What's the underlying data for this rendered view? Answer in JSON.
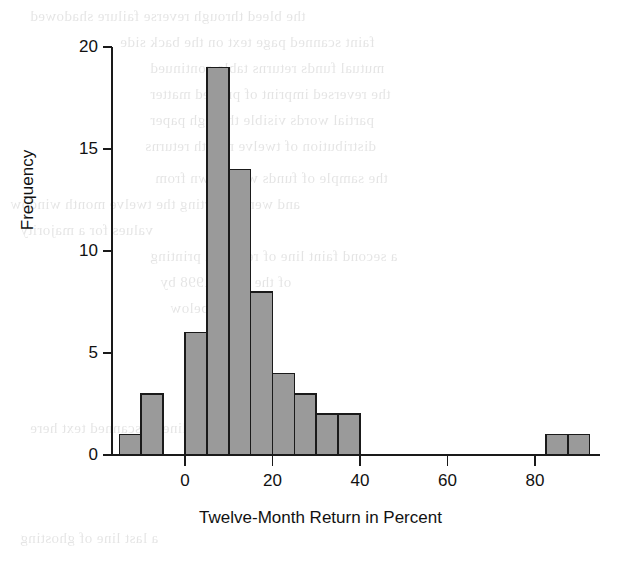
{
  "figure": {
    "background_color": "#ffffff",
    "bar_fill_color": "#9a9a9a",
    "bar_edge_color": "#1a1a1a",
    "axis_color": "#1a1a1a"
  },
  "axes": {
    "x_title": "Twelve-Month Return in Percent",
    "y_title": "Frequency",
    "x_ticks": [
      "0",
      "20",
      "40",
      "60",
      "80"
    ],
    "y_ticks": [
      "0",
      "5",
      "10",
      "15",
      "20"
    ]
  },
  "ghost_text": {
    "lines": [
      "the bleed through reverse failure shadowed",
      "faint scanned page text on the back side",
      "mutual funds returns table continued",
      "the reversed imprint of printed matter",
      "partial words visible through paper",
      "distribution of twelve month returns",
      "the sample of funds was drawn from",
      "and were reporting the twelve month window",
      "values for a majority",
      "a second faint line of reversed printing",
      "of the set in 1998 by",
      "shown below",
      "another reversed line of scanned text here",
      "a last line of ghosting"
    ]
  },
  "chart_data": {
    "type": "bar",
    "subtype": "histogram",
    "title": "",
    "xlabel": "Twelve-Month Return in Percent",
    "ylabel": "Frequency",
    "xlim": [
      -17.5,
      95
    ],
    "ylim": [
      0,
      20
    ],
    "xticks": [
      0,
      20,
      40,
      60,
      80
    ],
    "yticks": [
      0,
      5,
      10,
      15,
      20
    ],
    "grid": false,
    "legend": null,
    "bin_width": 5,
    "bin_edges": [
      -15,
      -10,
      -5,
      0,
      5,
      10,
      15,
      20,
      25,
      30,
      35,
      40,
      45,
      50,
      55,
      60,
      65,
      70,
      75,
      80,
      82.5,
      87.5,
      92.5
    ],
    "bins": [
      {
        "x0": -15,
        "x1": -10,
        "center": -12.5,
        "count": 1
      },
      {
        "x0": -10,
        "x1": -5,
        "center": -7.5,
        "count": 3
      },
      {
        "x0": -5,
        "x1": 0,
        "center": -2.5,
        "count": 0
      },
      {
        "x0": 0,
        "x1": 5,
        "center": 2.5,
        "count": 6
      },
      {
        "x0": 5,
        "x1": 10,
        "center": 7.5,
        "count": 19
      },
      {
        "x0": 10,
        "x1": 15,
        "center": 12.5,
        "count": 14
      },
      {
        "x0": 15,
        "x1": 20,
        "center": 17.5,
        "count": 8
      },
      {
        "x0": 20,
        "x1": 25,
        "center": 22.5,
        "count": 4
      },
      {
        "x0": 25,
        "x1": 30,
        "center": 27.5,
        "count": 3
      },
      {
        "x0": 30,
        "x1": 35,
        "center": 32.5,
        "count": 2
      },
      {
        "x0": 35,
        "x1": 40,
        "center": 37.5,
        "count": 2
      },
      {
        "x0": 40,
        "x1": 45,
        "center": 42.5,
        "count": 0
      },
      {
        "x0": 45,
        "x1": 50,
        "center": 47.5,
        "count": 0
      },
      {
        "x0": 50,
        "x1": 55,
        "center": 52.5,
        "count": 0
      },
      {
        "x0": 55,
        "x1": 60,
        "center": 57.5,
        "count": 0
      },
      {
        "x0": 60,
        "x1": 65,
        "center": 62.5,
        "count": 0
      },
      {
        "x0": 65,
        "x1": 70,
        "center": 67.5,
        "count": 0
      },
      {
        "x0": 70,
        "x1": 75,
        "center": 72.5,
        "count": 0
      },
      {
        "x0": 75,
        "x1": 80,
        "center": 77.5,
        "count": 0
      },
      {
        "x0": 82.5,
        "x1": 87.5,
        "center": 85,
        "count": 1
      },
      {
        "x0": 87.5,
        "x1": 92.5,
        "center": 90,
        "count": 1
      }
    ],
    "categories": [
      "-12.5",
      "-7.5",
      "-2.5",
      "2.5",
      "7.5",
      "12.5",
      "17.5",
      "22.5",
      "27.5",
      "32.5",
      "37.5",
      "42.5",
      "47.5",
      "52.5",
      "57.5",
      "62.5",
      "67.5",
      "72.5",
      "77.5",
      "85",
      "90"
    ],
    "values": [
      1,
      3,
      0,
      6,
      19,
      14,
      8,
      4,
      3,
      2,
      2,
      0,
      0,
      0,
      0,
      0,
      0,
      0,
      0,
      1,
      1
    ],
    "total_count": 67
  }
}
